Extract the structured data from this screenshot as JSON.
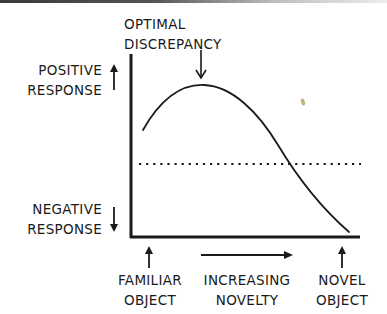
{
  "diagram": {
    "type": "inverted-U response curve",
    "peak_label": {
      "line1": "OPTIMAL",
      "line2": "DISCREPANCY"
    },
    "y_axis": {
      "top_label": {
        "line1": "POSITIVE",
        "line2": "RESPONSE",
        "arrow": "up"
      },
      "bottom_label": {
        "line1": "NEGATIVE",
        "line2": "RESPONSE",
        "arrow": "down"
      }
    },
    "x_axis": {
      "left_label": {
        "line1": "FAMILIAR",
        "line2": "OBJECT",
        "arrow": "up"
      },
      "middle_label": {
        "line1": "INCREASING",
        "line2": "NOVELTY",
        "arrow": "right"
      },
      "right_label": {
        "line1": "NOVEL",
        "line2": "OBJECT",
        "arrow": "up"
      }
    },
    "neutral_line": {
      "style": "dotted"
    },
    "colors": {
      "ink": "#1a1a1a",
      "smudge": "#b8a66a",
      "background": "#ffffff"
    }
  }
}
